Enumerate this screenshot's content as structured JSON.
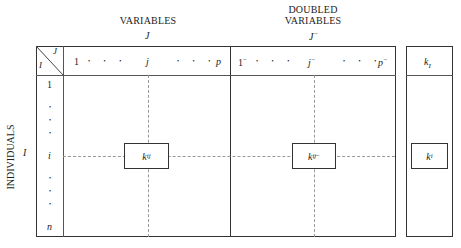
{
  "headers": {
    "variables_title": "VARIABLES",
    "variables_set": "J",
    "doubled_title_line1": "DOUBLED",
    "doubled_title_line2": "VARIABLES",
    "doubled_set": "J",
    "doubled_set_sup": "−",
    "individuals_title": "INDIVIDUALS",
    "individuals_set": "I"
  },
  "corner": {
    "col_label": "J",
    "row_label": "I"
  },
  "columns": {
    "first": "1",
    "middle": "j",
    "last": "p",
    "dots": "• • •"
  },
  "doubled_columns": {
    "first": "1",
    "middle": "j",
    "last": "p",
    "sup": "−",
    "dots": "• • •"
  },
  "rows": {
    "first": "1",
    "middle": "i",
    "last": "n",
    "dot": "•"
  },
  "cells": {
    "kij_main": "k",
    "kij_main_sub": "ij",
    "kij_doubled": "k",
    "kij_doubled_sub": "ij",
    "kij_doubled_sup": "−",
    "margin_header": "k",
    "margin_header_sub": "I",
    "margin_cell": "k",
    "margin_cell_sub": "i"
  }
}
